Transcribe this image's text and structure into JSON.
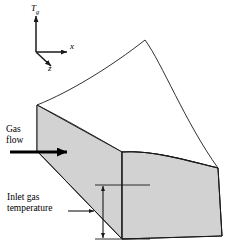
{
  "figure": {
    "type": "technical-diagram",
    "background_color": "#ffffff",
    "line_color": "#1a1a1a",
    "face_fill_color": "#d2d2d2",
    "top_face_fill_color": "#ffffff"
  },
  "axes": {
    "origin_label": "",
    "vertical": {
      "name": "Tg-axis",
      "symbol": "T",
      "subscript": "g",
      "direction": "up"
    },
    "horizontal": {
      "name": "x-axis",
      "symbol": "x",
      "subscript": "",
      "direction": "right"
    },
    "depth": {
      "name": "z-axis",
      "symbol": "z",
      "subscript": "",
      "direction": "down-left"
    }
  },
  "annotations": {
    "gas_flow": {
      "line1": "Gas",
      "line2": "flow",
      "arrow": "right-arrow"
    },
    "inlet_temperature": {
      "line1": "Inlet gas",
      "line2": "temperature",
      "leader": "leader-arrow-right",
      "dimension": "vertical-double-arrow"
    }
  }
}
